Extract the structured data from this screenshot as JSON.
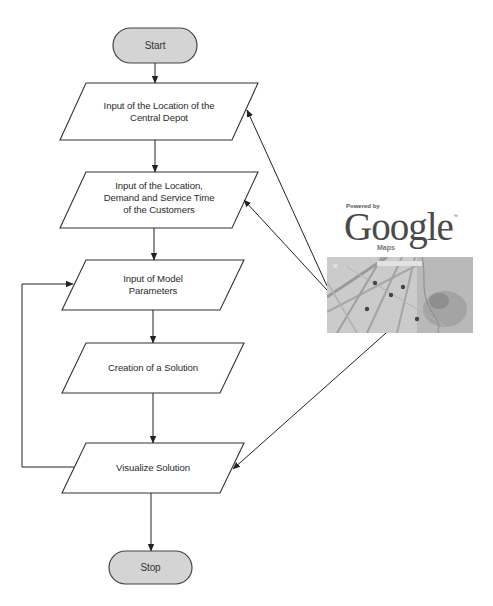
{
  "diagram": {
    "type": "flowchart",
    "nodes": {
      "start": {
        "label": "Start",
        "shape": "terminal"
      },
      "p1": {
        "label_line1": "Input of the Location of the",
        "label_line2": "Central Depot",
        "shape": "parallelogram"
      },
      "p2": {
        "label_line1": "Input of the Location,",
        "label_line2": "Demand and Service Time",
        "label_line3": "of the Customers",
        "shape": "parallelogram"
      },
      "p3": {
        "label_line1": "Input of Model",
        "label_line2": "Parameters",
        "shape": "parallelogram"
      },
      "p4": {
        "label": "Creation of a Solution",
        "shape": "parallelogram"
      },
      "p5": {
        "label": "Visualize Solution",
        "shape": "parallelogram"
      },
      "stop": {
        "label": "Stop",
        "shape": "terminal"
      }
    },
    "edges": [
      {
        "from": "start",
        "to": "p1"
      },
      {
        "from": "p1",
        "to": "p2"
      },
      {
        "from": "p2",
        "to": "p3"
      },
      {
        "from": "p3",
        "to": "p4"
      },
      {
        "from": "p4",
        "to": "p5"
      },
      {
        "from": "p5",
        "to": "stop"
      },
      {
        "from": "p5",
        "to": "p3",
        "note": "feedback loop"
      },
      {
        "from": "google_maps",
        "to": "p1"
      },
      {
        "from": "google_maps",
        "to": "p2"
      },
      {
        "from": "google_maps",
        "to": "p5"
      }
    ],
    "google_maps": {
      "powered_by": "Powered by",
      "brand": "Google",
      "trademark": "™",
      "product": "Maps",
      "icon": "map-thumbnail"
    },
    "colors": {
      "terminal_fill": "#d4d4d4",
      "stroke": "#333333",
      "shape_fill": "#ffffff",
      "map_fill": "#c9c9c9"
    }
  }
}
